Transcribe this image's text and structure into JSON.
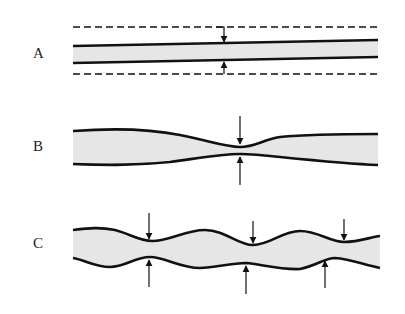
{
  "diagram": {
    "colors": {
      "fill": "#e6e6e6",
      "stroke": "#111111",
      "background": "#ffffff"
    },
    "panels": [
      {
        "id": "A",
        "label": "A",
        "description": "Uniform tube with dashed outer bounds; arrows indicate uniform constriction"
      },
      {
        "id": "B",
        "label": "B",
        "description": "Tube with a single local constriction marked by opposing arrows"
      },
      {
        "id": "C",
        "label": "C",
        "description": "Tube with multiple periodic constrictions marked by arrows"
      }
    ]
  }
}
